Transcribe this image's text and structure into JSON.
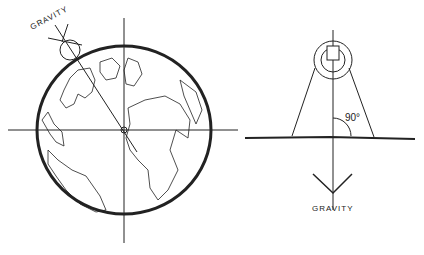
{
  "left_figure": {
    "label": "GRAVITY",
    "description": "Earth globe with local vertical line pointing toward center"
  },
  "right_figure": {
    "angle_label": "90°",
    "gravity_label": "GRAVITY",
    "description": "Tapered column standing perpendicular to ground with downward gravity arrow"
  },
  "colors": {
    "ink": "#222222",
    "background": "#ffffff"
  }
}
